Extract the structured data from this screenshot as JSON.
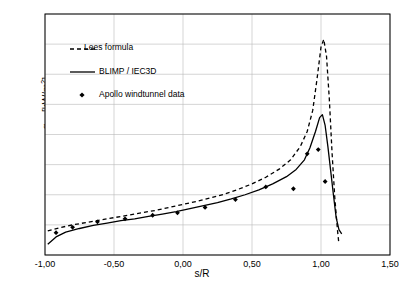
{
  "chart_data": {
    "type": "line",
    "title": "",
    "xlabel": "s/R",
    "ylabel_main": "q",
    "ylabel_sub": "gw",
    "ylabel_unit": "[kW/m",
    "ylabel_unit_sup": "2",
    "ylabel_unit_end": "]",
    "ylabel_full": "q_gw [kW/m^2]",
    "xlim": [
      -1.0,
      1.5
    ],
    "ylim": [
      0,
      400
    ],
    "xticks": [
      "-1,00",
      "-0,50",
      "0,00",
      "0,50",
      "1,00",
      "1,50"
    ],
    "xtick_values": [
      -1.0,
      -0.5,
      0.0,
      0.5,
      1.0,
      1.5
    ],
    "yticks": [
      "0",
      "50",
      "100",
      "150",
      "200",
      "250",
      "300",
      "350",
      "400"
    ],
    "ytick_values": [
      0,
      50,
      100,
      150,
      200,
      250,
      300,
      350,
      400
    ],
    "grid": true,
    "legend_position": "upper-left-inside",
    "series": [
      {
        "name": "Lees formula",
        "style": "dashed",
        "color": "#000000",
        "points": [
          [
            -0.98,
            40
          ],
          [
            -0.9,
            45
          ],
          [
            -0.8,
            50
          ],
          [
            -0.7,
            54
          ],
          [
            -0.6,
            58
          ],
          [
            -0.5,
            62
          ],
          [
            -0.4,
            66
          ],
          [
            -0.3,
            70
          ],
          [
            -0.2,
            74
          ],
          [
            -0.1,
            79
          ],
          [
            0.0,
            84
          ],
          [
            0.1,
            89
          ],
          [
            0.2,
            95
          ],
          [
            0.3,
            101
          ],
          [
            0.4,
            109
          ],
          [
            0.5,
            118
          ],
          [
            0.6,
            129
          ],
          [
            0.7,
            143
          ],
          [
            0.78,
            158
          ],
          [
            0.85,
            180
          ],
          [
            0.9,
            205
          ],
          [
            0.94,
            240
          ],
          [
            0.97,
            290
          ],
          [
            1.0,
            345
          ],
          [
            1.02,
            358
          ],
          [
            1.04,
            330
          ],
          [
            1.06,
            260
          ],
          [
            1.08,
            170
          ],
          [
            1.1,
            95
          ],
          [
            1.12,
            40
          ],
          [
            1.13,
            18
          ]
        ]
      },
      {
        "name": "BLIMP / IEC3D",
        "style": "solid",
        "color": "#000000",
        "points": [
          [
            -0.98,
            18
          ],
          [
            -0.92,
            30
          ],
          [
            -0.85,
            38
          ],
          [
            -0.75,
            44
          ],
          [
            -0.65,
            49
          ],
          [
            -0.55,
            53
          ],
          [
            -0.45,
            57
          ],
          [
            -0.35,
            60
          ],
          [
            -0.25,
            64
          ],
          [
            -0.15,
            68
          ],
          [
            -0.05,
            72
          ],
          [
            0.05,
            77
          ],
          [
            0.15,
            82
          ],
          [
            0.25,
            87
          ],
          [
            0.35,
            93
          ],
          [
            0.45,
            100
          ],
          [
            0.55,
            108
          ],
          [
            0.65,
            118
          ],
          [
            0.75,
            130
          ],
          [
            0.82,
            142
          ],
          [
            0.88,
            158
          ],
          [
            0.92,
            178
          ],
          [
            0.96,
            205
          ],
          [
            0.99,
            228
          ],
          [
            1.01,
            233
          ],
          [
            1.03,
            215
          ],
          [
            1.05,
            180
          ],
          [
            1.07,
            140
          ],
          [
            1.09,
            100
          ],
          [
            1.11,
            62
          ],
          [
            1.13,
            42
          ],
          [
            1.15,
            35
          ]
        ]
      },
      {
        "name": "Apollo windtunnel data",
        "style": "markers",
        "marker": "diamond",
        "color": "#000000",
        "points": [
          [
            -0.92,
            37
          ],
          [
            -0.8,
            46
          ],
          [
            -0.62,
            55
          ],
          [
            -0.42,
            60
          ],
          [
            -0.22,
            66
          ],
          [
            -0.04,
            70
          ],
          [
            0.16,
            79
          ],
          [
            0.38,
            92
          ],
          [
            0.6,
            113
          ],
          [
            0.8,
            110
          ],
          [
            0.9,
            168
          ],
          [
            0.98,
            175
          ],
          [
            1.03,
            122
          ]
        ]
      }
    ],
    "legend": [
      {
        "label": "Lees formula",
        "style": "dashed"
      },
      {
        "label": "BLIMP / IEC3D",
        "style": "solid"
      },
      {
        "label": "Apollo windtunnel data",
        "style": "diamond-marker"
      }
    ]
  }
}
